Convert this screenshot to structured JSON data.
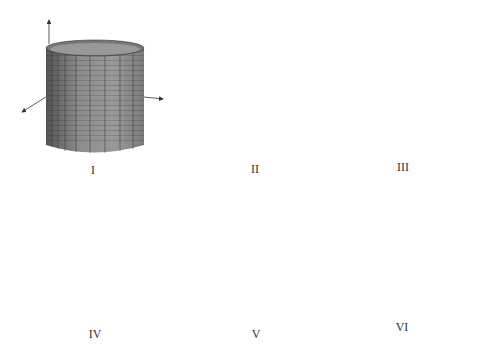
{
  "figure": {
    "panels": [
      {
        "id": "I",
        "label": "I",
        "shape": "circular cylinder (vertical)"
      },
      {
        "id": "II",
        "label": "II",
        "shape": "horizontal plane"
      },
      {
        "id": "III",
        "label": "III",
        "shape": "cone (apex up)"
      },
      {
        "id": "IV",
        "label": "IV",
        "shape": "vertical plane"
      },
      {
        "id": "V",
        "label": "V",
        "shape": "sphere"
      },
      {
        "id": "VI",
        "label": "VI",
        "shape": "elliptic/tilted cylinder"
      }
    ]
  },
  "colors": {
    "surface": "#8a8a8a",
    "surface_dark": "#5a5a5a",
    "grid": "#2a2a2a",
    "axis": "#333333",
    "background": "#ffffff"
  }
}
